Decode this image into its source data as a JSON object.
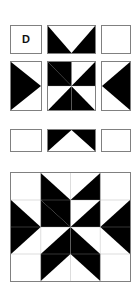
{
  "diagram": {
    "block_label": "D",
    "block_name": "Eight-Pointed Star",
    "colors": {
      "dark": "#000000",
      "light": "#ffffff",
      "outline": "#808080",
      "seam": "#9a9a9a",
      "background": "#ffffff",
      "label_text": "#111111"
    },
    "rows": [
      {
        "row_index": 1,
        "cells": [
          {
            "name": "label-square",
            "unit_type": "plain-square",
            "shade": "light",
            "label": "D"
          },
          {
            "name": "top-center-unit",
            "unit_type": "flying-geese-down",
            "shade": "dark-and-light"
          },
          {
            "name": "top-right-unit",
            "unit_type": "plain-square",
            "shade": "light",
            "label": ""
          }
        ]
      },
      {
        "row_index": 2,
        "cells": [
          {
            "name": "middle-left-unit",
            "unit_type": "flying-geese-right",
            "shade": "dark-and-light"
          },
          {
            "name": "center-pinwheel-unit",
            "unit_type": "pinwheel",
            "shade": "dark-and-light"
          },
          {
            "name": "middle-right-unit",
            "unit_type": "flying-geese-left",
            "shade": "dark-and-light"
          }
        ]
      },
      {
        "row_index": 3,
        "cells": [
          {
            "name": "bottom-left-unit",
            "unit_type": "plain-square",
            "shade": "light",
            "label": ""
          },
          {
            "name": "bottom-center-unit",
            "unit_type": "flying-geese-up",
            "shade": "dark-and-light"
          },
          {
            "name": "bottom-right-unit",
            "unit_type": "plain-square",
            "shade": "light",
            "label": ""
          }
        ]
      }
    ],
    "assembled_block": {
      "name": "assembled-star-block",
      "unit_type": "eight-pointed-star",
      "grid": "4x4",
      "points": 8
    }
  }
}
